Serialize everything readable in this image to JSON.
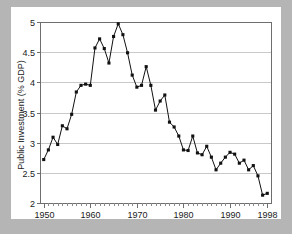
{
  "figure": {
    "background_color": "#b5b5b5",
    "card_color": "#ffffff",
    "frame_color": "#6e6e6e",
    "grid_color": "#c9c9c9",
    "series_color": "#111111"
  },
  "chart_data": {
    "type": "line",
    "title": "",
    "subtitle": "",
    "xlabel": "",
    "ylabel": "Public Investment (% GDP)",
    "xlim": [
      1949.2,
      1998.8
    ],
    "ylim": [
      2,
      5
    ],
    "grid": true,
    "legend": false,
    "marker": "square",
    "x_tick_labels": [
      "1950",
      "1960",
      "1970",
      "1980",
      "1990",
      "1998"
    ],
    "x_tick_values": [
      1950,
      1960,
      1970,
      1980,
      1990,
      1998
    ],
    "x_minor_tick_step": 1,
    "y_tick_labels": [
      "2",
      "2.5",
      "3",
      "3.5",
      "4",
      "4.5",
      "5"
    ],
    "y_tick_values": [
      2,
      2.5,
      3,
      3.5,
      4,
      4.5,
      5
    ],
    "x": [
      1950,
      1951,
      1952,
      1953,
      1954,
      1955,
      1956,
      1957,
      1958,
      1959,
      1960,
      1961,
      1962,
      1963,
      1964,
      1965,
      1966,
      1967,
      1968,
      1969,
      1970,
      1971,
      1972,
      1973,
      1974,
      1975,
      1976,
      1977,
      1978,
      1979,
      1980,
      1981,
      1982,
      1983,
      1984,
      1985,
      1986,
      1987,
      1988,
      1989,
      1990,
      1991,
      1992,
      1993,
      1994,
      1995,
      1996,
      1997,
      1998
    ],
    "series": [
      {
        "name": "Public Investment (% GDP)",
        "values": [
          2.72,
          2.88,
          3.09,
          2.97,
          3.28,
          3.23,
          3.47,
          3.84,
          3.95,
          3.97,
          3.95,
          4.57,
          4.72,
          4.56,
          4.32,
          4.76,
          4.97,
          4.79,
          4.49,
          4.12,
          3.92,
          3.95,
          4.26,
          3.95,
          3.54,
          3.69,
          3.79,
          3.34,
          3.26,
          3.11,
          2.88,
          2.87,
          3.11,
          2.83,
          2.8,
          2.94,
          2.76,
          2.55,
          2.66,
          2.76,
          2.84,
          2.81,
          2.66,
          2.71,
          2.55,
          2.62,
          2.45,
          2.13,
          2.16
        ]
      }
    ]
  }
}
